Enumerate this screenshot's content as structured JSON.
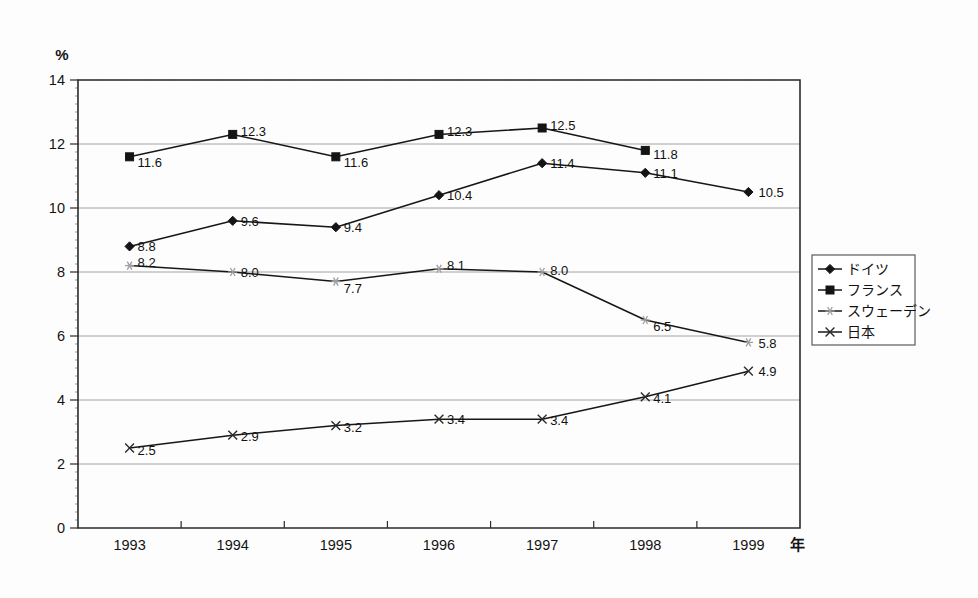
{
  "chart_data": {
    "type": "line",
    "title": "",
    "subtitle": "",
    "xlabel": "年",
    "ylabel": "%",
    "x": [
      1993,
      1994,
      1995,
      1996,
      1997,
      1998,
      1999
    ],
    "categories": [
      "1993",
      "1994",
      "1995",
      "1996",
      "1997",
      "1998",
      "1999"
    ],
    "ylim": [
      0,
      14
    ],
    "yticks": [
      0,
      2,
      4,
      6,
      8,
      10,
      12,
      14
    ],
    "ytick_labels": [
      "0",
      "2",
      "4",
      "6",
      "8",
      "10",
      "12",
      "14"
    ],
    "grid": true,
    "legend_position": "right",
    "series": [
      {
        "name": "ドイツ",
        "marker": "diamond",
        "color": "#141414",
        "values": [
          8.8,
          9.6,
          9.4,
          10.4,
          11.4,
          11.1,
          10.5
        ],
        "labels": [
          "8.8",
          "9.6",
          "9.4",
          "10.4",
          "11.4",
          "11.1",
          "10.5"
        ]
      },
      {
        "name": "フランス",
        "marker": "square",
        "color": "#141414",
        "values": [
          11.6,
          12.3,
          11.6,
          12.3,
          12.5,
          11.8,
          null
        ],
        "labels": [
          "11.6",
          "12.3",
          "11.6",
          "12.3",
          "12.5",
          "11.8",
          ""
        ]
      },
      {
        "name": "スウェーデン",
        "marker": "star",
        "color": "#9e9e9e",
        "values": [
          8.2,
          8.0,
          7.7,
          8.1,
          8.0,
          6.5,
          5.8
        ],
        "labels": [
          "8.2",
          "8.0",
          "7.7",
          "8.1",
          "8.0",
          "6.5",
          "5.8"
        ]
      },
      {
        "name": "日本",
        "marker": "cross",
        "color": "#2a2a2a",
        "values": [
          2.5,
          2.9,
          3.2,
          3.4,
          3.4,
          4.1,
          4.9
        ],
        "labels": [
          "2.5",
          "2.9",
          "3.2",
          "3.4",
          "3.4",
          "4.1",
          "4.9"
        ]
      }
    ]
  },
  "axes": {
    "y_unit": "%",
    "x_unit": "年"
  },
  "legend": {
    "entries": [
      {
        "label": "ドイツ",
        "marker": "diamond"
      },
      {
        "label": "フランス",
        "marker": "square"
      },
      {
        "label": "スウェーデン",
        "marker": "star"
      },
      {
        "label": "日本",
        "marker": "cross"
      }
    ]
  }
}
